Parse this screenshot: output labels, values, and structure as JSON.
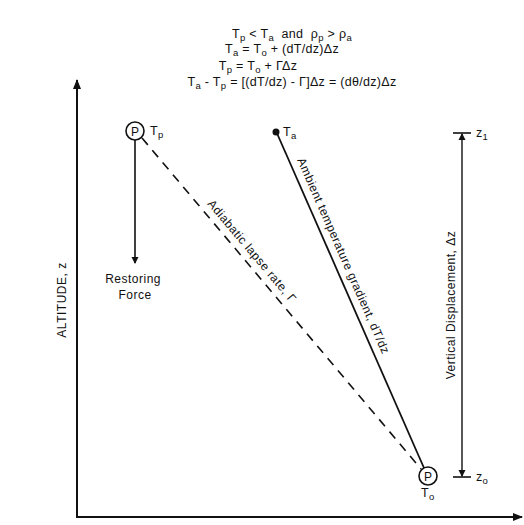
{
  "equations": {
    "line1": {
      "parts": [
        "T",
        "p",
        " < T",
        "a",
        "  and  ",
        "ρ",
        "p",
        " > ",
        "ρ",
        "a"
      ]
    },
    "line2": {
      "parts": [
        "T",
        "a",
        " = T",
        "o",
        " + (dT/dz)Δz"
      ]
    },
    "line3": {
      "parts": [
        "T",
        "p",
        " = T",
        "o",
        " + ΓΔz"
      ]
    },
    "line4": {
      "parts": [
        "T",
        "a",
        " - T",
        "p",
        " = [(dT/dz) - Γ]Δz = (dθ/dz)Δz"
      ]
    }
  },
  "axes": {
    "y_label": "ALTITUDE, z",
    "x_label": ""
  },
  "points": {
    "parcel_top": {
      "symbol": "P",
      "label_main": "T",
      "label_sub": "p"
    },
    "ambient_top": {
      "label_main": "T",
      "label_sub": "a"
    },
    "parcel_bottom": {
      "symbol": "P",
      "label_main": "T",
      "label_sub": "o"
    }
  },
  "lines": {
    "adiabatic": "Adiabatic lapse rate, Γ",
    "ambient": "Ambient temperature gradient, dT/dz"
  },
  "restoring_force": {
    "line1": "Restoring",
    "line2": "Force"
  },
  "displacement": {
    "label": "Vertical Displacement, Δz",
    "top_main": "z",
    "top_sub": "1",
    "bottom_main": "z",
    "bottom_sub": "o"
  },
  "colors": {
    "ink": "#111111",
    "background": "#ffffff"
  }
}
